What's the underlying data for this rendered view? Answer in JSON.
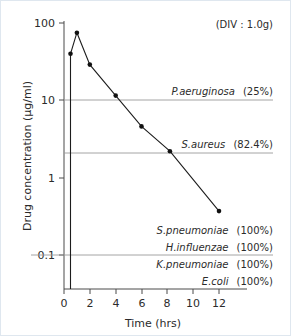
{
  "annotation": "(DIV : 1.0g)",
  "chart_data": {
    "type": "line",
    "title": "",
    "subtitle": "",
    "annotation": "(DIV : 1.0g)",
    "xlabel": "Time (hrs)",
    "ylabel": "Drug concentration (μg/ml)",
    "yscale": "log",
    "xlim": [
      0,
      13
    ],
    "ylim": [
      0.04,
      100
    ],
    "grid": false,
    "legend": "none",
    "xticks": [
      0,
      2,
      4,
      6,
      8,
      10,
      12
    ],
    "xtick_labels": [
      "0",
      "2",
      "4",
      "6",
      "8",
      "10",
      "12"
    ],
    "yticks": [
      0.1,
      1,
      10,
      100
    ],
    "ytick_labels": [
      "0.1",
      "1",
      "10",
      "100"
    ],
    "series": [
      {
        "name": "Drug concentration",
        "x": [
          0.5,
          1.0,
          2.0,
          4.0,
          6.0,
          8.2,
          12.0
        ],
        "values": [
          40,
          75,
          29,
          11.5,
          4.6,
          2.2,
          0.37
        ]
      }
    ],
    "reference_lines": [
      {
        "label": "P.aeruginosa",
        "percent": "(25%)",
        "value": 13
      },
      {
        "label": "S.aureus",
        "percent": "(82.4%)",
        "value": 3.4
      },
      {
        "label": "H.influenzae",
        "percent": "(100%)",
        "value": 0.1
      }
    ],
    "organism_labels": [
      {
        "name": "P.aeruginosa",
        "percent": "(25%)"
      },
      {
        "name": "S.aureus",
        "percent": "(82.4%)"
      },
      {
        "name": "S.pneumoniae",
        "percent": "(100%)"
      },
      {
        "name": "H.influenzae",
        "percent": "(100%)"
      },
      {
        "name": "K.pneumoniae",
        "percent": "(100%)"
      },
      {
        "name": "E.coli",
        "percent": "(100%)"
      }
    ],
    "colors": {
      "curve": "#1d1d1d",
      "marker": "#111111",
      "reference_line": "#9a9a9a",
      "axis": "#4a4a4a",
      "text": "#2b2b2b",
      "background": "#ffffff",
      "border": "#dfe7ef"
    }
  }
}
